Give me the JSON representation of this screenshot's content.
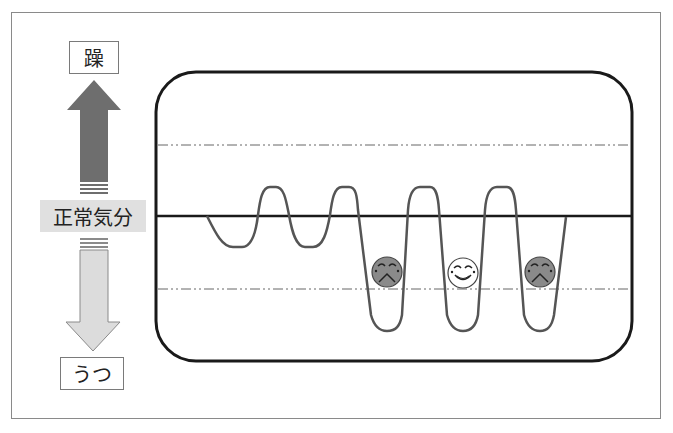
{
  "labels": {
    "mania": "躁",
    "normal": "正常気分",
    "depression": "うつ"
  },
  "arrows": {
    "up": {
      "direction": "up",
      "meaning": "mania",
      "color": "#6e6e6e"
    },
    "down": {
      "direction": "down",
      "meaning": "depression",
      "color": "#dcdcdc"
    }
  },
  "chart_panel": {
    "reference_lines": [
      {
        "name": "upper-threshold",
        "style": "dash-dot",
        "y": 145
      },
      {
        "name": "baseline-normal",
        "style": "solid",
        "y": 216
      },
      {
        "name": "lower-threshold",
        "style": "dash-dot",
        "y": 289
      }
    ],
    "faces": [
      {
        "type": "sad",
        "fill": "#8a8a8a"
      },
      {
        "type": "happy",
        "fill": "#ffffff"
      },
      {
        "type": "sad",
        "fill": "#8a8a8a"
      }
    ]
  }
}
